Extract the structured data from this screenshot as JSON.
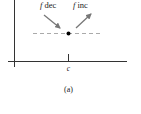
{
  "figure": {
    "caption": "(a)",
    "labels": {
      "left_arrow": "f dec",
      "left_arrow_italic": "f",
      "left_arrow_rest": " dec",
      "right_arrow": "f inc",
      "right_arrow_italic": "f",
      "right_arrow_rest": " inc",
      "x_tick": "c"
    },
    "colors": {
      "axis": "#333333",
      "arrow": "#777777",
      "dashed_line": "#aaaaaa",
      "point": "#000000"
    }
  }
}
